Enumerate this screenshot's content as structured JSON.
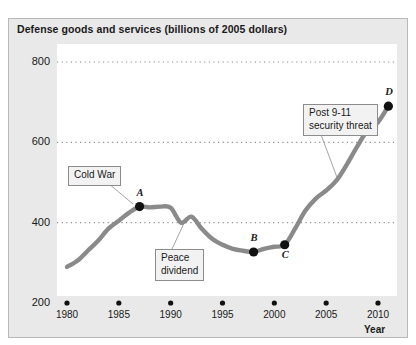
{
  "chart_data": {
    "type": "line",
    "title": "Defense goods and services (billions of 2005 dollars)",
    "xlabel": "Year",
    "ylabel": "",
    "xlim": [
      1979,
      2011.5
    ],
    "ylim": [
      200,
      800
    ],
    "grid": true,
    "legend": "none",
    "y_ticks": [
      "800",
      "600",
      "400",
      "200"
    ],
    "y_tick_values": [
      800,
      600,
      400,
      200
    ],
    "x_ticks": [
      "1980",
      "1985",
      "1990",
      "1995",
      "2000",
      "2005",
      "2010"
    ],
    "x_tick_values": [
      1980,
      1985,
      1990,
      1995,
      2000,
      2005,
      2010
    ],
    "series": [
      {
        "name": "Defense goods and services",
        "color": "#8a8a8a",
        "x": [
          1980,
          1981,
          1982,
          1983,
          1984,
          1985,
          1986,
          1987,
          1988,
          1989,
          1990,
          1991,
          1992,
          1993,
          1994,
          1995,
          1996,
          1997,
          1998,
          1999,
          2000,
          2001,
          2002,
          2003,
          2004,
          2005,
          2006,
          2007,
          2008,
          2009,
          2010,
          2011
        ],
        "y": [
          290,
          305,
          330,
          355,
          385,
          405,
          425,
          440,
          438,
          440,
          437,
          400,
          415,
          385,
          360,
          345,
          335,
          330,
          327,
          335,
          340,
          345,
          385,
          430,
          460,
          480,
          505,
          545,
          590,
          630,
          650,
          690
        ]
      }
    ],
    "points": [
      {
        "id": "A",
        "label": "A",
        "x": 1987,
        "y": 440,
        "label_position": "above"
      },
      {
        "id": "B",
        "label": "B",
        "x": 1998,
        "y": 327,
        "label_position": "above"
      },
      {
        "id": "C",
        "label": "C",
        "x": 2001,
        "y": 345,
        "label_position": "below"
      },
      {
        "id": "D",
        "label": "D",
        "x": 2011,
        "y": 690,
        "label_position": "above"
      }
    ],
    "annotations": [
      {
        "id": "cold-war",
        "text": "Cold War",
        "target_point": "A"
      },
      {
        "id": "peace-dividend",
        "text": "Peace\ndividend",
        "target_x": 1992,
        "target_y": 400
      },
      {
        "id": "post-911",
        "text": "Post 9-11\nsecurity threat",
        "target_x": 2006,
        "target_y": 505
      }
    ]
  },
  "colors": {
    "line": "#8a8a8a",
    "panel_background": "#e9e9e9",
    "plot_background": "#ffffff",
    "text": "#1a1a1a",
    "gridline": "#8f8f8f",
    "callout_border": "#8c8c8c",
    "callout_background": "#f2f2f2",
    "marker": "#111111"
  }
}
